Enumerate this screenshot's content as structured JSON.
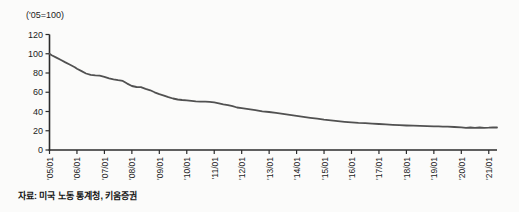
{
  "header": {
    "unit_label": "('05=100)"
  },
  "footer": {
    "source": "자료: 미국 노동 통계청, 키움증권"
  },
  "chart_data": {
    "type": "line",
    "title": "",
    "unit_label": "('05=100)",
    "xlabel": "",
    "ylabel": "",
    "ylim": [
      0,
      120
    ],
    "xlim": [
      2005,
      2021.3
    ],
    "y_ticks": [
      0,
      20,
      40,
      60,
      80,
      100,
      120
    ],
    "x_tick_years": [
      2005,
      2006,
      2007,
      2008,
      2009,
      2010,
      2011,
      2012,
      2013,
      2014,
      2015,
      2016,
      2017,
      2018,
      2019,
      2020,
      2021
    ],
    "x_tick_labels": [
      "'05/01",
      "'06/01",
      "'07/01",
      "'08/01",
      "'09/01",
      "'10/01",
      "'11/01",
      "'12/01",
      "'13/01",
      "'14/01",
      "'15/01",
      "'16/01",
      "'17/01",
      "'18/01",
      "'19/01",
      "'20/01",
      "'21/01"
    ],
    "grid": false,
    "legend": "none",
    "line_color": "#515151",
    "axis_color": "#2b2b2b",
    "text_color": "#1c1c1c",
    "series": [
      {
        "name": "index-05-100",
        "points": [
          [
            2005.0,
            100
          ],
          [
            2005.08,
            98.5
          ],
          [
            2005.25,
            96
          ],
          [
            2005.42,
            93.5
          ],
          [
            2005.58,
            91
          ],
          [
            2005.75,
            88.5
          ],
          [
            2005.92,
            86
          ],
          [
            2006.0,
            84.5
          ],
          [
            2006.17,
            82
          ],
          [
            2006.33,
            79.5
          ],
          [
            2006.5,
            78
          ],
          [
            2006.67,
            77.5
          ],
          [
            2006.83,
            77.2
          ],
          [
            2007.0,
            76
          ],
          [
            2007.17,
            74.5
          ],
          [
            2007.33,
            73.5
          ],
          [
            2007.5,
            72.5
          ],
          [
            2007.67,
            71.8
          ],
          [
            2007.83,
            69
          ],
          [
            2008.0,
            66.5
          ],
          [
            2008.17,
            65.5
          ],
          [
            2008.33,
            65.2
          ],
          [
            2008.5,
            63.5
          ],
          [
            2008.67,
            62
          ],
          [
            2008.83,
            60
          ],
          [
            2009.0,
            58
          ],
          [
            2009.17,
            56.5
          ],
          [
            2009.33,
            55
          ],
          [
            2009.5,
            53.5
          ],
          [
            2009.67,
            52.5
          ],
          [
            2009.83,
            52
          ],
          [
            2010.0,
            51.5
          ],
          [
            2010.17,
            51
          ],
          [
            2010.33,
            50.5
          ],
          [
            2010.5,
            50.2
          ],
          [
            2010.67,
            50.3
          ],
          [
            2010.83,
            50
          ],
          [
            2011.0,
            49.5
          ],
          [
            2011.17,
            48.5
          ],
          [
            2011.33,
            47.5
          ],
          [
            2011.5,
            46.5
          ],
          [
            2011.67,
            45.5
          ],
          [
            2011.83,
            44.2
          ],
          [
            2012.0,
            43.5
          ],
          [
            2012.25,
            42.5
          ],
          [
            2012.5,
            41.5
          ],
          [
            2012.75,
            40.2
          ],
          [
            2013.0,
            39.5
          ],
          [
            2013.25,
            38.5
          ],
          [
            2013.5,
            37.5
          ],
          [
            2013.75,
            36.5
          ],
          [
            2014.0,
            35.5
          ],
          [
            2014.25,
            34.5
          ],
          [
            2014.5,
            33.5
          ],
          [
            2014.75,
            32.5
          ],
          [
            2015.0,
            31.5
          ],
          [
            2015.25,
            30.8
          ],
          [
            2015.5,
            30
          ],
          [
            2015.75,
            29.3
          ],
          [
            2016.0,
            28.7
          ],
          [
            2016.25,
            28.2
          ],
          [
            2016.5,
            27.8
          ],
          [
            2016.75,
            27.4
          ],
          [
            2017.0,
            27
          ],
          [
            2017.25,
            26.6
          ],
          [
            2017.5,
            26.2
          ],
          [
            2017.75,
            25.8
          ],
          [
            2018.0,
            25.5
          ],
          [
            2018.25,
            25.2
          ],
          [
            2018.5,
            25
          ],
          [
            2018.75,
            24.7
          ],
          [
            2019.0,
            24.5
          ],
          [
            2019.17,
            24.6
          ],
          [
            2019.33,
            24.2
          ],
          [
            2019.5,
            24.3
          ],
          [
            2019.75,
            23.9
          ],
          [
            2020.0,
            23.6
          ],
          [
            2020.17,
            23
          ],
          [
            2020.33,
            23.4
          ],
          [
            2020.5,
            23.1
          ],
          [
            2020.67,
            23.4
          ],
          [
            2020.83,
            23.1
          ],
          [
            2021.0,
            23.3
          ],
          [
            2021.15,
            23.6
          ],
          [
            2021.3,
            23.4
          ]
        ]
      }
    ]
  }
}
